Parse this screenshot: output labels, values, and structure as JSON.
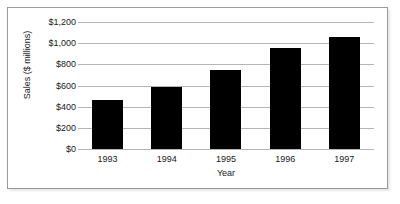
{
  "chart_data": {
    "type": "bar",
    "title": "",
    "subtitle": "",
    "xlabel": "Year",
    "ylabel": "Sales ($ millions)",
    "categories": [
      "1993",
      "1994",
      "1995",
      "1996",
      "1997"
    ],
    "values": [
      460,
      590,
      750,
      950,
      1060
    ],
    "ylim": [
      0,
      1200
    ],
    "ytick_values": [
      0,
      200,
      400,
      600,
      800,
      1000,
      1200
    ],
    "ytick_labels": [
      "$0",
      "$200",
      "$400",
      "$600",
      "$800",
      "$1,000",
      "$1,200"
    ],
    "grid": "horizontal",
    "legend": "none",
    "bar_color": "#000000",
    "gridline_color": "#b4b4b4",
    "background_color": "#ffffff",
    "border_color": "#9a9a9a"
  }
}
